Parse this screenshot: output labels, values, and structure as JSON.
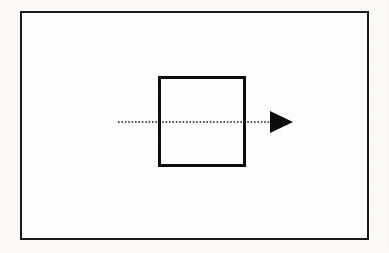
{
  "diagram": {
    "title": "",
    "canvas": {
      "width": 389,
      "height": 253,
      "background_color": "#fbfaf8"
    },
    "shapes": {
      "outer_rectangle": {
        "name": "outer boundary rectangle",
        "x": 20,
        "y": 11,
        "width": 349,
        "height": 229,
        "stroke_color": "#1a1a1a",
        "stroke_width": 2,
        "fill_color": "#ffffff",
        "label": ""
      },
      "inner_square": {
        "name": "inner square block",
        "x": 158,
        "y": 76,
        "width": 88,
        "height": 91,
        "stroke_color": "#0d0d0d",
        "stroke_width": 3,
        "fill_color": "#ffffff",
        "label": ""
      }
    },
    "connectors": {
      "flow_line": {
        "name": "horizontal dotted flow line with arrowhead",
        "style": "dotted",
        "dot_length": 1.6,
        "dot_gap": 1.8,
        "stroke_color": "#1a1a1a",
        "stroke_width": 1.6,
        "x_start": 118,
        "x_end": 272,
        "y": 122,
        "direction": "left-to-right",
        "label": ""
      },
      "arrow_head": {
        "name": "filled triangular arrowhead pointing right",
        "tip_x": 293,
        "tip_y": 122,
        "back_x": 270,
        "top_y": 111,
        "bottom_y": 133,
        "fill_color": "#0d0d0d",
        "label": ""
      }
    }
  }
}
